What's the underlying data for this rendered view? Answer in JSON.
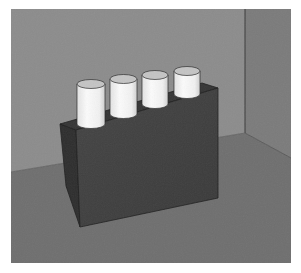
{
  "scene": {
    "description": "3D render of a dark rectangular block holding four white cylinders, placed in the corner of a grey room",
    "object_count": 4,
    "colors": {
      "back_wall": "#8c8c8c",
      "right_wall": "#7b7b7b",
      "floor": "#6f6f6f",
      "box_front": "#404040",
      "box_side": "#2e2e2e",
      "box_top": "#353535",
      "cylinder_body": "#f4f4f4",
      "cylinder_shade": "#d6d6d6",
      "cylinder_top": "#c4c4c4",
      "edge": "#1e1e1e",
      "frame_bg": "#ffffff"
    },
    "items": [
      {
        "name": "cylinder-1"
      },
      {
        "name": "cylinder-2"
      },
      {
        "name": "cylinder-3"
      },
      {
        "name": "cylinder-4"
      }
    ]
  }
}
